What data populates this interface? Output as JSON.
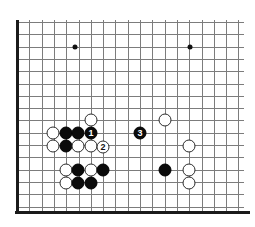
{
  "diagram": {
    "board_type": "go-board-corner",
    "background_color": "#ffffff",
    "grid_color": "#7c7c7c",
    "edge_color": "#1a1a1a",
    "black_stone_color": "#0b0b0b",
    "white_stone_color": "#ffffff",
    "stone_diameter": 13,
    "grid_spacing": 12.3,
    "origin_x": 17,
    "origin_y": 22,
    "columns": 19,
    "rows": 16
  },
  "grid": {
    "vertical_lines_x": [
      17,
      29.3,
      41.6,
      53.9,
      66.2,
      78.5,
      90.8,
      103.1,
      115.4,
      127.7,
      140,
      152.3,
      164.6,
      176.9,
      189.2,
      201.5,
      213.8,
      226.1,
      238.4
    ],
    "horizontal_lines_y": [
      22,
      34.3,
      46.6,
      58.9,
      71.2,
      83.5,
      95.8,
      108.1,
      120.4,
      132.7,
      145,
      157.3,
      169.6,
      181.9,
      194.2,
      206.5
    ],
    "edge_left_x": 17,
    "edge_left_y1": 20,
    "edge_left_y2": 214,
    "edge_bottom_y": 211,
    "edge_bottom_x1": 15,
    "edge_bottom_x2": 250,
    "right_open_x": 244,
    "top_open_y": 20
  },
  "star_points": [
    {
      "name": "star-point-left",
      "x": 75,
      "y": 47
    },
    {
      "name": "star-point-right",
      "x": 190,
      "y": 47
    }
  ],
  "stones": [
    {
      "id": "w1",
      "color": "white",
      "x": 53,
      "y": 133,
      "label": ""
    },
    {
      "id": "b1",
      "color": "black",
      "x": 66,
      "y": 133,
      "label": ""
    },
    {
      "id": "b2",
      "color": "black",
      "x": 78,
      "y": 133,
      "label": ""
    },
    {
      "id": "m1",
      "color": "black",
      "x": 91,
      "y": 133,
      "label": "1"
    },
    {
      "id": "wt",
      "color": "white",
      "x": 91,
      "y": 120,
      "label": ""
    },
    {
      "id": "m3",
      "color": "black",
      "x": 140,
      "y": 133,
      "label": "3"
    },
    {
      "id": "wt2",
      "color": "white",
      "x": 165,
      "y": 120,
      "label": ""
    },
    {
      "id": "w2",
      "color": "white",
      "x": 53,
      "y": 146,
      "label": ""
    },
    {
      "id": "b3",
      "color": "black",
      "x": 66,
      "y": 146,
      "label": ""
    },
    {
      "id": "w3",
      "color": "white",
      "x": 78,
      "y": 146,
      "label": ""
    },
    {
      "id": "w4",
      "color": "white",
      "x": 91,
      "y": 146,
      "label": ""
    },
    {
      "id": "m2",
      "color": "white",
      "x": 103,
      "y": 147,
      "label": "2"
    },
    {
      "id": "w5",
      "color": "white",
      "x": 189,
      "y": 146,
      "label": ""
    },
    {
      "id": "w6",
      "color": "white",
      "x": 66,
      "y": 170,
      "label": ""
    },
    {
      "id": "b4",
      "color": "black",
      "x": 78,
      "y": 170,
      "label": ""
    },
    {
      "id": "w7",
      "color": "white",
      "x": 91,
      "y": 170,
      "label": ""
    },
    {
      "id": "b5",
      "color": "black",
      "x": 103,
      "y": 170,
      "label": ""
    },
    {
      "id": "b6",
      "color": "black",
      "x": 165,
      "y": 170,
      "label": ""
    },
    {
      "id": "w8",
      "color": "white",
      "x": 189,
      "y": 170,
      "label": ""
    },
    {
      "id": "w9",
      "color": "white",
      "x": 66,
      "y": 183,
      "label": ""
    },
    {
      "id": "b7",
      "color": "black",
      "x": 78,
      "y": 183,
      "label": ""
    },
    {
      "id": "b8",
      "color": "black",
      "x": 91,
      "y": 183,
      "label": ""
    },
    {
      "id": "w10",
      "color": "white",
      "x": 189,
      "y": 183,
      "label": ""
    }
  ],
  "move_labels": [
    {
      "number": "1",
      "color": "black"
    },
    {
      "number": "2",
      "color": "white"
    },
    {
      "number": "3",
      "color": "black"
    }
  ]
}
